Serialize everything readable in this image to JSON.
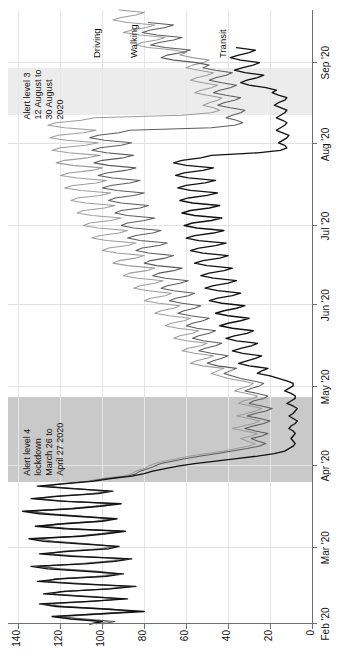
{
  "chart_data": {
    "type": "line",
    "title": "",
    "subtitle": "",
    "xlabel": "",
    "ylabel": "",
    "orientation": "rotated-90-ccw",
    "grid": true,
    "legend_position": "inline-top",
    "xlim_labels": [
      "Feb '20",
      "Sep '20"
    ],
    "ylim": [
      0,
      145
    ],
    "yticks": [
      0,
      20,
      40,
      60,
      80,
      100,
      120,
      140
    ],
    "ytick_labels": [
      "0",
      "20",
      "40",
      "60",
      "80",
      "100",
      "120",
      "140"
    ],
    "xticks": [
      "Feb '20",
      "Mar '20",
      "Apr '20",
      "May '20",
      "Jun '20",
      "Jul '20",
      "Aug '20",
      "Sep '20"
    ],
    "series": [
      {
        "name": "Driving",
        "color": "#9d9d9d",
        "values": [
          103,
          97,
          112,
          118,
          99,
          83,
          101,
          120,
          124,
          104,
          92,
          108,
          126,
          117,
          100,
          88,
          110,
          129,
          121,
          103,
          94,
          106,
          122,
          131,
          112,
          99,
          90,
          113,
          128,
          119,
          101,
          96,
          109,
          125,
          133,
          114,
          102,
          93,
          116,
          130,
          122,
          104,
          97,
          111,
          127,
          136,
          118,
          105,
          95,
          119,
          132,
          124,
          106,
          99,
          113,
          129,
          121,
          108,
          100,
          90,
          86,
          84,
          80,
          78,
          75,
          70,
          64,
          58,
          50,
          42,
          36,
          30,
          27,
          31,
          34,
          29,
          26,
          32,
          38,
          33,
          28,
          25,
          30,
          36,
          31,
          27,
          24,
          29,
          35,
          33,
          28,
          26,
          31,
          37,
          34,
          30,
          28,
          33,
          40,
          44,
          48,
          45,
          42,
          52,
          58,
          55,
          50,
          47,
          56,
          62,
          59,
          53,
          50,
          60,
          66,
          63,
          57,
          54,
          64,
          70,
          67,
          61,
          58,
          68,
          75,
          72,
          66,
          63,
          73,
          80,
          77,
          70,
          67,
          78,
          85,
          82,
          75,
          71,
          83,
          90,
          87,
          79,
          75,
          88,
          95,
          92,
          84,
          80,
          93,
          100,
          97,
          88,
          84,
          98,
          105,
          101,
          92,
          88,
          102,
          109,
          106,
          96,
          91,
          105,
          112,
          109,
          99,
          94,
          108,
          115,
          112,
          101,
          96,
          110,
          118,
          114,
          103,
          98,
          112,
          120,
          116,
          105,
          100,
          114,
          122,
          118,
          107,
          101,
          116,
          124,
          120,
          108,
          102,
          117,
          125,
          121,
          109,
          103,
          118,
          126,
          122,
          110,
          104,
          62,
          48,
          44,
          47,
          52,
          49,
          45,
          43,
          50,
          56,
          53,
          48,
          45,
          52,
          58,
          55,
          50,
          47,
          54,
          60,
          57,
          52,
          49,
          57,
          63,
          60,
          66,
          78,
          84,
          81,
          74,
          70,
          82,
          90,
          86,
          79,
          75,
          88,
          95,
          91,
          84,
          80,
          92
        ],
        "values_note": "Apple Mobility index, baseline 13 Jan 2020 = 100"
      },
      {
        "name": "Walking",
        "color": "#5c5c5c",
        "values": [
          100,
          94,
          108,
          122,
          105,
          85,
          96,
          118,
          128,
          108,
          90,
          104,
          124,
          120,
          98,
          86,
          106,
          126,
          123,
          100,
          92,
          102,
          120,
          130,
          110,
          96,
          88,
          110,
          126,
          118,
          99,
          94,
          107,
          123,
          131,
          112,
          100,
          91,
          114,
          128,
          120,
          102,
          95,
          109,
          125,
          134,
          116,
          103,
          93,
          117,
          130,
          122,
          104,
          97,
          111,
          127,
          119,
          106,
          98,
          88,
          84,
          82,
          78,
          75,
          72,
          66,
          60,
          53,
          45,
          38,
          31,
          25,
          22,
          26,
          29,
          24,
          21,
          27,
          32,
          28,
          23,
          20,
          25,
          31,
          27,
          22,
          19,
          24,
          30,
          28,
          23,
          21,
          26,
          32,
          29,
          25,
          23,
          28,
          34,
          38,
          42,
          39,
          36,
          45,
          50,
          47,
          43,
          40,
          48,
          54,
          51,
          46,
          43,
          52,
          57,
          54,
          49,
          46,
          55,
          60,
          57,
          52,
          49,
          58,
          64,
          61,
          56,
          53,
          62,
          68,
          65,
          59,
          56,
          66,
          72,
          69,
          63,
          59,
          70,
          76,
          73,
          66,
          62,
          74,
          80,
          77,
          70,
          66,
          78,
          84,
          81,
          73,
          69,
          82,
          88,
          84,
          76,
          72,
          85,
          91,
          88,
          80,
          75,
          88,
          94,
          91,
          82,
          78,
          91,
          97,
          94,
          85,
          80,
          93,
          100,
          96,
          87,
          82,
          95,
          102,
          98,
          89,
          84,
          97,
          104,
          100,
          90,
          85,
          98,
          105,
          101,
          91,
          86,
          99,
          106,
          102,
          92,
          87,
          48,
          37,
          33,
          36,
          41,
          38,
          34,
          32,
          39,
          45,
          42,
          37,
          34,
          41,
          47,
          44,
          39,
          36,
          43,
          49,
          46,
          41,
          38,
          46,
          52,
          49,
          55,
          66,
          72,
          69,
          62,
          58,
          70,
          77,
          73,
          66,
          62,
          74,
          81,
          77,
          70,
          66,
          78
        ],
        "values_note": "Apple Mobility index, baseline 13 Jan 2020 = 100"
      },
      {
        "name": "Transit",
        "color": "#111111",
        "values": [
          106,
          100,
          115,
          124,
          102,
          80,
          99,
          122,
          130,
          106,
          88,
          110,
          128,
          118,
          96,
          84,
          112,
          131,
          120,
          98,
          90,
          108,
          126,
          134,
          108,
          94,
          86,
          115,
          130,
          116,
          97,
          92,
          111,
          128,
          135,
          110,
          98,
          89,
          118,
          132,
          118,
          100,
          93,
          113,
          130,
          138,
          114,
          101,
          91,
          120,
          134,
          120,
          102,
          95,
          115,
          131,
          117,
          104,
          96,
          86,
          80,
          76,
          70,
          64,
          56,
          46,
          36,
          26,
          18,
          13,
          11,
          9,
          8,
          9,
          10,
          9,
          8,
          9,
          11,
          10,
          8,
          7,
          9,
          11,
          9,
          8,
          7,
          9,
          12,
          10,
          8,
          8,
          10,
          13,
          11,
          9,
          9,
          12,
          16,
          20,
          26,
          24,
          21,
          30,
          35,
          31,
          27,
          24,
          33,
          38,
          34,
          29,
          26,
          36,
          41,
          37,
          31,
          28,
          38,
          44,
          40,
          34,
          30,
          40,
          46,
          42,
          36,
          32,
          43,
          49,
          45,
          38,
          34,
          45,
          51,
          47,
          40,
          36,
          47,
          53,
          49,
          42,
          38,
          50,
          56,
          52,
          44,
          40,
          52,
          58,
          54,
          46,
          41,
          54,
          60,
          56,
          47,
          42,
          55,
          61,
          57,
          48,
          43,
          56,
          62,
          58,
          49,
          44,
          57,
          63,
          59,
          50,
          45,
          58,
          64,
          60,
          51,
          46,
          59,
          65,
          61,
          52,
          47,
          60,
          66,
          62,
          53,
          48,
          26,
          15,
          12,
          13,
          16,
          14,
          12,
          11,
          14,
          17,
          15,
          13,
          12,
          14,
          17,
          15,
          13,
          12,
          15,
          18,
          16,
          13,
          12,
          16,
          19,
          17,
          22,
          30,
          34,
          31,
          26,
          23,
          32,
          37,
          33,
          28,
          25,
          34,
          39,
          35,
          30,
          27,
          36
        ],
        "values_note": "Apple Mobility index, baseline 13 Jan 2020 = 100"
      }
    ],
    "annotations": [
      {
        "id": "alert-level-4",
        "text": "Alert level 4\nlockdown\nMarch 26 to\nApril 27 2020",
        "band_start": "2020-03-26",
        "band_end": "2020-04-27",
        "band_color": "#c9c9c9"
      },
      {
        "id": "alert-level-3",
        "text": "Alert level 3\n12 August to\n30 August\n2020",
        "band_start": "2020-08-12",
        "band_end": "2020-08-30",
        "band_color": "#ececec"
      }
    ],
    "series_labels": [
      {
        "name": "Driving"
      },
      {
        "name": "Walking"
      },
      {
        "name": "Transit"
      }
    ]
  }
}
